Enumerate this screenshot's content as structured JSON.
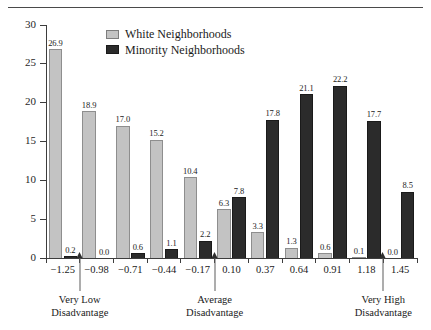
{
  "figure": {
    "top_caption_fragment": "",
    "ylabel": "Percentage"
  },
  "legend": {
    "position": "top-center",
    "items": [
      {
        "label": "White Neighborhoods",
        "color": "#c3c3c3",
        "key": "white"
      },
      {
        "label": "Minority Neighborhoods",
        "color": "#2b2b2b",
        "key": "minority"
      }
    ]
  },
  "annotations": [
    {
      "label_line1": "Very Low",
      "label_line2": "Disadvantage",
      "at_x": -1.115
    },
    {
      "label_line1": "Average",
      "label_line2": "Disadvantage",
      "at_x": -0.035
    },
    {
      "label_line1": "Very High",
      "label_line2": "Disadvantage",
      "at_x": 1.315
    }
  ],
  "chart_data": {
    "type": "bar",
    "title": "",
    "xlabel": "",
    "ylabel": "Percentage",
    "ylim": [
      0,
      30
    ],
    "yticks": [
      0,
      5,
      10,
      15,
      20,
      25,
      30
    ],
    "ytick_labels": [
      "0",
      "5",
      "10",
      "15",
      "20",
      "25",
      "30"
    ],
    "grid": false,
    "legend_position": "top-center",
    "categories": [
      "-1.25",
      "-0.98",
      "-0.71",
      "-0.44",
      "-0.17",
      "0.10",
      "0.37",
      "0.64",
      "0.91",
      "1.18",
      "1.45"
    ],
    "series": [
      {
        "name": "White Neighborhoods",
        "color": "#c3c3c3",
        "values": [
          26.9,
          18.9,
          17.0,
          15.2,
          10.4,
          6.3,
          3.3,
          1.3,
          0.6,
          0.1,
          0.0
        ],
        "labels": [
          "26.9",
          "18.9",
          "17.0",
          "15.2",
          "10.4",
          "6.3",
          "3.3",
          "1.3",
          "0.6",
          "0.1",
          "0.0"
        ]
      },
      {
        "name": "Minority Neighborhoods",
        "color": "#2b2b2b",
        "values": [
          0.2,
          0.0,
          0.6,
          1.1,
          2.2,
          7.8,
          17.8,
          21.1,
          22.2,
          17.7,
          8.5
        ],
        "labels": [
          "0.2",
          "0.0",
          "0.6",
          "1.1",
          "2.2",
          "7.8",
          "17.8",
          "21.1",
          "22.2",
          "17.7",
          "8.5"
        ]
      }
    ]
  }
}
